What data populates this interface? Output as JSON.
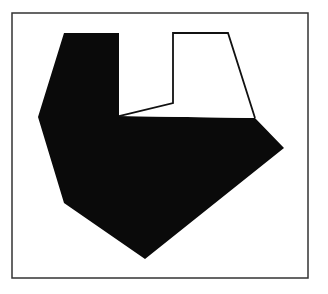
{
  "diagram": {
    "colors": {
      "background": "#ffffff",
      "frame": "#333333",
      "fill": "#0a0a0a",
      "outline": "#111111"
    },
    "frame": {
      "x": 12,
      "y": 13,
      "width": 296,
      "height": 265
    },
    "black_polygon_points": "64,33 119,33 119,116 255,118 284,148 145,259 64,203 38,117",
    "white_outline_points": "119,116 173,103 173,33 228,33 255,118"
  }
}
